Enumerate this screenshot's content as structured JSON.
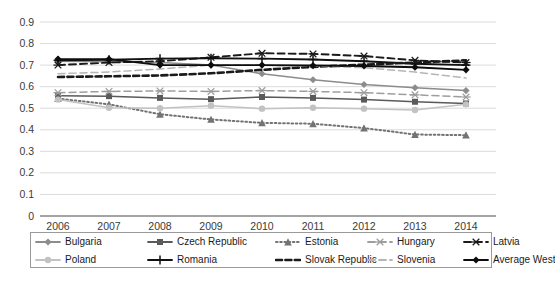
{
  "chart_data": {
    "type": "line",
    "title": "",
    "xlabel": "",
    "ylabel": "",
    "x": [
      2006,
      2007,
      2008,
      2009,
      2010,
      2011,
      2012,
      2013,
      2014
    ],
    "categories": [
      "2006",
      "2007",
      "2008",
      "2009",
      "2010",
      "2011",
      "2012",
      "2013",
      "2014"
    ],
    "ylim": [
      0,
      0.9
    ],
    "ytick_labels": [
      "0",
      "0.1",
      "0.2",
      "0.3",
      "0.4",
      "0.5",
      "0.6",
      "0.7",
      "0.8",
      "0.9"
    ],
    "ytick_values": [
      0,
      0.1,
      0.2,
      0.3,
      0.4,
      0.5,
      0.6,
      0.7,
      0.8,
      0.9
    ],
    "grid": true,
    "legend_position": "bottom",
    "series": [
      {
        "name": "Bulgaria",
        "color": "#8c8c8c",
        "marker": "diamond",
        "dash": "solid",
        "values": [
          0.718,
          0.716,
          0.712,
          0.7,
          0.66,
          0.632,
          0.61,
          0.595,
          0.582
        ]
      },
      {
        "name": "Czech Republic",
        "color": "#5a5a5a",
        "marker": "square",
        "dash": "solid",
        "values": [
          0.558,
          0.556,
          0.548,
          0.542,
          0.552,
          0.548,
          0.54,
          0.53,
          0.522
        ]
      },
      {
        "name": "Estonia",
        "color": "#737373",
        "marker": "triangle",
        "dash": "dotted",
        "values": [
          0.545,
          0.518,
          0.472,
          0.448,
          0.432,
          0.428,
          0.408,
          0.378,
          0.375
        ]
      },
      {
        "name": "Hungary",
        "color": "#9e9e9e",
        "marker": "asterisk",
        "dash": "dashed",
        "values": [
          0.572,
          0.578,
          0.58,
          0.578,
          0.582,
          0.578,
          0.572,
          0.562,
          0.552
        ]
      },
      {
        "name": "Latvia",
        "color": "#1a1a1a",
        "marker": "asterisk",
        "dash": "dashed",
        "values": [
          0.7,
          0.712,
          0.718,
          0.736,
          0.755,
          0.752,
          0.742,
          0.722,
          0.712
        ]
      },
      {
        "name": "Poland",
        "color": "#c2c2c2",
        "marker": "circle",
        "dash": "solid",
        "values": [
          0.54,
          0.502,
          0.5,
          0.512,
          0.498,
          0.502,
          0.498,
          0.492,
          0.518
        ]
      },
      {
        "name": "Romania",
        "color": "#111111",
        "marker": "plus",
        "dash": "solid",
        "values": [
          0.722,
          0.725,
          0.73,
          0.732,
          0.73,
          0.726,
          0.718,
          0.706,
          0.7
        ]
      },
      {
        "name": "Slovak Republic",
        "color": "#1a1a1a",
        "marker": "none",
        "dash": "dash-heavy",
        "values": [
          0.645,
          0.648,
          0.652,
          0.662,
          0.678,
          0.692,
          0.702,
          0.712,
          0.722
        ]
      },
      {
        "name": "Slovenia",
        "color": "#b5b5b5",
        "marker": "none",
        "dash": "dashed",
        "values": [
          0.66,
          0.668,
          0.682,
          0.7,
          0.7,
          0.696,
          0.688,
          0.668,
          0.64
        ]
      },
      {
        "name": "Average West",
        "color": "#0d0d0d",
        "marker": "diamond",
        "dash": "solid",
        "values": [
          0.728,
          0.728,
          0.7,
          0.7,
          0.7,
          0.698,
          0.696,
          0.69,
          0.678
        ]
      }
    ]
  },
  "legend": {
    "row1": [
      {
        "label": "Bulgaria"
      },
      {
        "label": "Czech Republic"
      },
      {
        "label": "Estonia"
      },
      {
        "label": "Hungary"
      },
      {
        "label": "Latvia"
      }
    ],
    "row2": [
      {
        "label": "Poland"
      },
      {
        "label": "Romania"
      },
      {
        "label": "Slovak Republic"
      },
      {
        "label": "Slovenia"
      },
      {
        "label": "Average West"
      }
    ]
  },
  "caption": {
    "text": ""
  }
}
